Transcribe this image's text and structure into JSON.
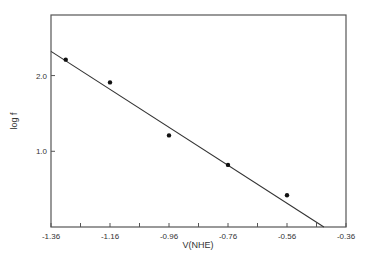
{
  "chart_data": {
    "type": "scatter",
    "title": "",
    "xlabel": "V(NHE)",
    "ylabel": "log f",
    "xlim": [
      -1.36,
      -0.36
    ],
    "ylim": [
      0.0,
      2.8
    ],
    "x_ticks": [
      -1.36,
      -1.26,
      -1.16,
      -1.06,
      -0.96,
      -0.86,
      -0.76,
      -0.66,
      -0.56,
      -0.46,
      -0.36
    ],
    "x_tick_labels": [
      "-1.36",
      "-1.16",
      "-0.96",
      "-0.76",
      "-0.56",
      "-0.36"
    ],
    "y_tick_labels": [
      "2.0",
      "1.0"
    ],
    "y_ticks": [
      1.0,
      2.0
    ],
    "grid": false,
    "legend": null,
    "series": [
      {
        "name": "data",
        "kind": "scatter",
        "x": [
          -1.31,
          -1.16,
          -0.96,
          -0.76,
          -0.56
        ],
        "y": [
          2.21,
          1.91,
          1.21,
          0.82,
          0.42
        ]
      },
      {
        "name": "linear fit",
        "kind": "line",
        "x": [
          -1.36,
          -0.435
        ],
        "y": [
          2.32,
          0.0
        ]
      }
    ]
  }
}
